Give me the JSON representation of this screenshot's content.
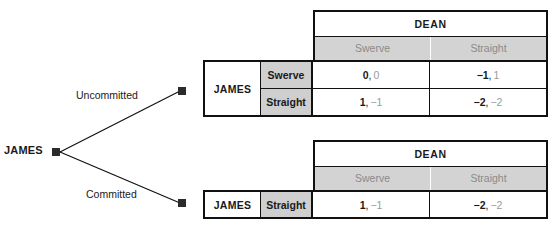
{
  "tree": {
    "root_label": "JAMES",
    "branches": [
      {
        "label": "Uncommitted"
      },
      {
        "label": "Committed"
      }
    ]
  },
  "matrices": [
    {
      "id": "uncommitted-matrix",
      "column_player": "DEAN",
      "column_strategies": [
        "Swerve",
        "Straight"
      ],
      "row_player": "JAMES",
      "row_strategies": [
        "Swerve",
        "Straight"
      ],
      "cells": [
        [
          {
            "row_payoff": "0",
            "sep": ",",
            "col_payoff": "0"
          },
          {
            "row_payoff": "−1",
            "sep": ",",
            "col_payoff": "1"
          }
        ],
        [
          {
            "row_payoff": "1",
            "sep": ",",
            "col_payoff": "−1"
          },
          {
            "row_payoff": "−2",
            "sep": ",",
            "col_payoff": "−2"
          }
        ]
      ]
    },
    {
      "id": "committed-matrix",
      "column_player": "DEAN",
      "column_strategies": [
        "Swerve",
        "Straight"
      ],
      "row_player": "JAMES",
      "row_strategies": [
        "Straight"
      ],
      "cells": [
        [
          {
            "row_payoff": "1",
            "sep": ",",
            "col_payoff": "−1"
          },
          {
            "row_payoff": "−2",
            "sep": ",",
            "col_payoff": "−2"
          }
        ]
      ]
    }
  ],
  "colors": {
    "line": "#111111",
    "node": "#2b2b2b",
    "header_band": "#d3d3d3",
    "strategy_band": "#cfcfcf",
    "row_payoff_text": "#1a1a1a",
    "col_payoff_text": "#9a9a9a",
    "col_strategy_text": "#8a8a8a",
    "background": "#ffffff"
  }
}
